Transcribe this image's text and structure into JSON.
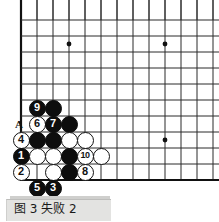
{
  "figure": {
    "caption": "图 3  失败 2",
    "caption_label": "图 3",
    "caption_title": "失败 2",
    "board_marker_letter": "A"
  },
  "board": {
    "type": "go-board-corner",
    "grid_spacing_px": 16,
    "origin_x_px": 21,
    "origin_y_px": 20,
    "columns": 13,
    "rows": 11,
    "left_edge_is_border": true,
    "bottom_edge_is_border": true,
    "line_color": "#2b2b2b",
    "border_color": "#111111",
    "background_color": "#ffffff",
    "star_points": [
      {
        "x_px": 69,
        "y_px": 44
      },
      {
        "x_px": 165,
        "y_px": 44
      },
      {
        "x_px": 165,
        "y_px": 140
      }
    ]
  },
  "stones": [
    {
      "color": "black",
      "label": "9",
      "x_px": 37,
      "y_px": 108
    },
    {
      "color": "black",
      "label": "",
      "x_px": 53,
      "y_px": 108
    },
    {
      "color": "white",
      "label": "6",
      "x_px": 37,
      "y_px": 124
    },
    {
      "color": "black",
      "label": "7",
      "x_px": 53,
      "y_px": 124
    },
    {
      "color": "black",
      "label": "",
      "x_px": 69,
      "y_px": 124
    },
    {
      "color": "white",
      "label": "4",
      "x_px": 21,
      "y_px": 140
    },
    {
      "color": "black",
      "label": "",
      "x_px": 37,
      "y_px": 140
    },
    {
      "color": "black",
      "label": "",
      "x_px": 53,
      "y_px": 140
    },
    {
      "color": "white",
      "label": "",
      "x_px": 69,
      "y_px": 140
    },
    {
      "color": "white",
      "label": "",
      "x_px": 85,
      "y_px": 140
    },
    {
      "color": "black",
      "label": "1",
      "x_px": 21,
      "y_px": 156
    },
    {
      "color": "white",
      "label": "",
      "x_px": 37,
      "y_px": 156
    },
    {
      "color": "white",
      "label": "",
      "x_px": 53,
      "y_px": 156
    },
    {
      "color": "black",
      "label": "",
      "x_px": 69,
      "y_px": 156
    },
    {
      "color": "white",
      "label": "10",
      "x_px": 85,
      "y_px": 156
    },
    {
      "color": "white",
      "label": "",
      "x_px": 101,
      "y_px": 156
    },
    {
      "color": "white",
      "label": "2",
      "x_px": 21,
      "y_px": 172
    },
    {
      "color": "white",
      "label": "",
      "x_px": 53,
      "y_px": 172
    },
    {
      "color": "black",
      "label": "",
      "x_px": 69,
      "y_px": 172
    },
    {
      "color": "white",
      "label": "8",
      "x_px": 85,
      "y_px": 172
    },
    {
      "color": "black",
      "label": "5",
      "x_px": 37,
      "y_px": 188
    },
    {
      "color": "black",
      "label": "3",
      "x_px": 53,
      "y_px": 188
    }
  ],
  "letter_markers": [
    {
      "text": "A",
      "x_px": 15,
      "y_px": 119
    }
  ]
}
